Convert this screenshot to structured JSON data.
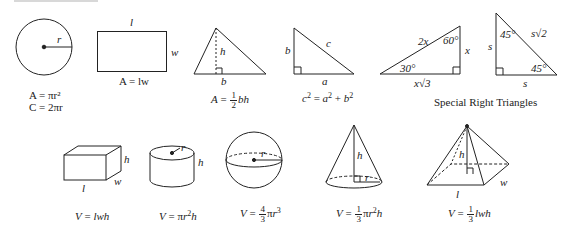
{
  "sheet": {
    "title": "Reference",
    "plane_figures": [
      {
        "id": "circle",
        "labels": {
          "radius": "r"
        },
        "formula_lines": [
          "A = πr²",
          "C = 2πr"
        ]
      },
      {
        "id": "rectangle",
        "labels": {
          "length": "l",
          "width": "w"
        },
        "formula": "A = lw"
      },
      {
        "id": "triangle",
        "labels": {
          "height": "h",
          "base": "b"
        },
        "formula": "A = ½bh"
      },
      {
        "id": "right-triangle",
        "labels": {
          "a": "a",
          "b": "b",
          "c": "c"
        },
        "formula": "c² = a² + b²"
      },
      {
        "id": "triangle-30-60-90",
        "labels": {
          "hyp": "2x",
          "short": "x",
          "long": "x√3",
          "angle_a": "30°",
          "angle_b": "60°"
        }
      },
      {
        "id": "triangle-45-45-90",
        "labels": {
          "hyp": "s√2",
          "leg1": "s",
          "leg2": "s",
          "angle_a": "45°",
          "angle_b": "45°"
        }
      }
    ],
    "special_caption": "Special Right Triangles",
    "solids": [
      {
        "id": "rectangular-prism",
        "labels": {
          "l": "l",
          "w": "w",
          "h": "h"
        },
        "formula": "V = lwh"
      },
      {
        "id": "cylinder",
        "labels": {
          "r": "r",
          "h": "h"
        },
        "formula": "V = πr²h"
      },
      {
        "id": "sphere",
        "labels": {
          "r": "r"
        },
        "formula": "V = 4/3 πr³"
      },
      {
        "id": "cone",
        "labels": {
          "r": "r",
          "h": "h"
        },
        "formula": "V = 1/3 πr²h"
      },
      {
        "id": "pyramid",
        "labels": {
          "l": "l",
          "w": "w",
          "h": "h"
        },
        "formula": "V = 1/3 lwh"
      }
    ],
    "text": {
      "A": "A",
      "C": "C",
      "V": "V",
      "eq": " = ",
      "pi": "π",
      "two": "2",
      "one": "1",
      "three": "3",
      "four": "4",
      "plus": " + ",
      "r": "r",
      "h": "h",
      "b": "b",
      "l": "l",
      "w": "w",
      "a": "a",
      "c": "c",
      "lw": "lw",
      "lwh": "lwh",
      "bh": "bh",
      "x": "x",
      "s": "s",
      "sqrt3": "√3",
      "sqrt2": "√2",
      "deg30": "30°",
      "deg60": "60°",
      "deg45": "45°",
      "twox": "2x"
    }
  }
}
